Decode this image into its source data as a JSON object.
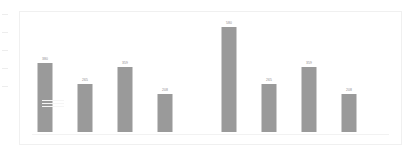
{
  "chart_data": {
    "type": "bar",
    "title": "",
    "subtitle": "",
    "xlabel": "",
    "ylabel": "",
    "categories": [
      "1",
      "2",
      "3",
      "4"
    ],
    "grid": false,
    "legend": "none",
    "ylim": [
      0,
      620
    ],
    "bar_color": "#9a9a9a",
    "label_color": "#8c8c8c",
    "frame_color": "#f0f0f0",
    "background": "#ffffff",
    "groups": [
      {
        "name": "group-1",
        "values": [
          380,
          265,
          359,
          208
        ],
        "labels": [
          "380",
          "265",
          "359",
          "208"
        ]
      },
      {
        "name": "group-2",
        "values": [
          580,
          265,
          359,
          208
        ],
        "labels": [
          "580",
          "265",
          "359",
          "208"
        ]
      }
    ]
  }
}
